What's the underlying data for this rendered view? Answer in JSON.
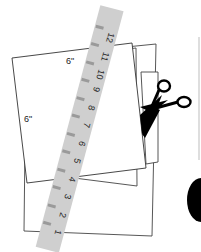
{
  "illustration": {
    "description": "Stacked paper squares with a ruler and scissors",
    "paper_label_top": "6\"",
    "paper_label_left": "6\"",
    "ruler": {
      "ticks": [
        "1",
        "2",
        "3",
        "4",
        "5",
        "6",
        "7",
        "8",
        "9",
        "10",
        "11",
        "12"
      ],
      "color": "#cfcfcf",
      "mark_color": "#9a9a9a"
    },
    "colors": {
      "paper_fill": "#ffffff",
      "outline": "#333333",
      "scissors": "#000000",
      "side_line": "#bdbdbd"
    }
  }
}
